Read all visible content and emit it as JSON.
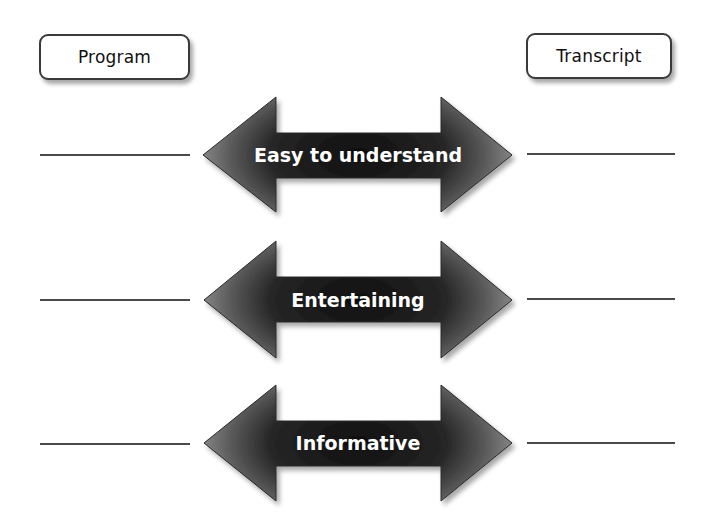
{
  "headers": {
    "left": "Program",
    "right": "Transcript"
  },
  "rows": [
    {
      "label": "Easy to understand",
      "left_blank": "",
      "right_blank": ""
    },
    {
      "label": "Entertaining",
      "left_blank": "",
      "right_blank": ""
    },
    {
      "label": "Informative",
      "left_blank": "",
      "right_blank": ""
    }
  ],
  "colors": {
    "arrow_center": "#141414",
    "arrow_edge": "#8a8a8a",
    "outline": "#2a2a2a",
    "rule": "#4a4a4a",
    "text_on_arrow": "#ffffff"
  }
}
